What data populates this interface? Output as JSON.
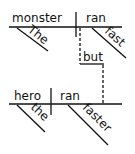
{
  "diagram": {
    "type": "sentence-diagram",
    "clause1": {
      "subject": "monster",
      "verb": "ran",
      "subject_modifier": "The",
      "verb_modifier": "fast"
    },
    "conjunction": "but",
    "clause2": {
      "subject": "hero",
      "verb": "ran",
      "subject_modifier": "the",
      "verb_modifier": "faster"
    }
  }
}
